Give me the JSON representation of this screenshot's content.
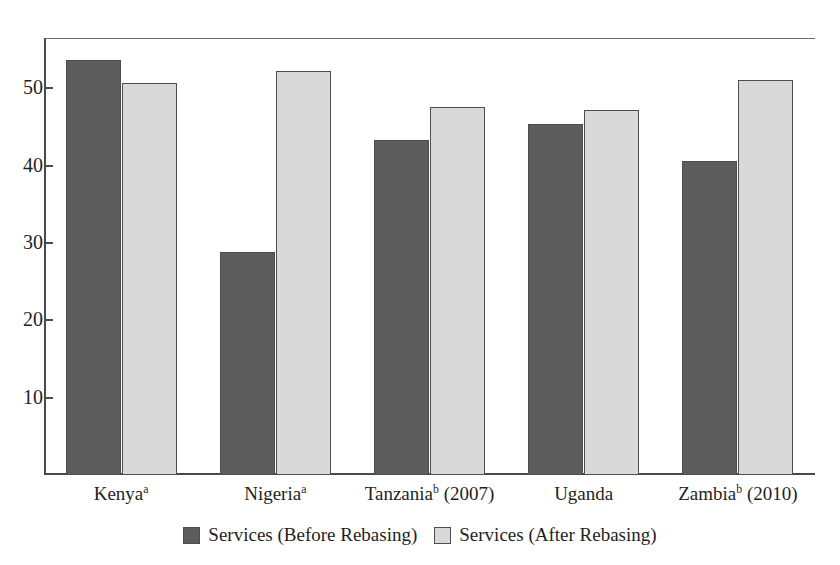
{
  "figure": {
    "clipped_title_remnant": "",
    "background_color": "#ffffff"
  },
  "chart_data": {
    "type": "bar",
    "title": "",
    "subtitle": "",
    "xlabel": "",
    "ylabel": "",
    "categories": [
      "Kenyaᵃ",
      "Nigeriaᵃ",
      "Tanzaniaᵇ (2007)",
      "Uganda",
      "Zambiaᵇ (2010)"
    ],
    "category_parts": [
      {
        "name": "Kenya",
        "note": "a",
        "year": ""
      },
      {
        "name": "Nigeria",
        "note": "a",
        "year": ""
      },
      {
        "name": "Tanzania",
        "note": "b",
        "year": "(2007)"
      },
      {
        "name": "Uganda",
        "note": "",
        "year": ""
      },
      {
        "name": "Zambia",
        "note": "b",
        "year": "(2010)"
      }
    ],
    "series": [
      {
        "name": "Services (Before Rebasing)",
        "key": "before",
        "color": "#5d5d5d",
        "values": [
          53.7,
          28.8,
          43.3,
          45.4,
          40.6
        ]
      },
      {
        "name": "Services (After Rebasing)",
        "key": "after",
        "color": "#d9d9d9",
        "values": [
          50.7,
          52.2,
          47.6,
          47.2,
          51.1
        ]
      }
    ],
    "ylim": [
      0,
      56.5
    ],
    "yticks": [
      10,
      20,
      30,
      40,
      50
    ],
    "ytick_labels": [
      "10",
      "20",
      "30",
      "40",
      "50"
    ],
    "grid": false,
    "legend_position": "bottom-center",
    "bar_border_color": "#4d4d4d",
    "axis_color": "#4a4a4a"
  },
  "legend": {
    "items": [
      {
        "label": "Services (Before Rebasing)",
        "swatch": "before"
      },
      {
        "label": "Services (After Rebasing)",
        "swatch": "after"
      }
    ]
  }
}
